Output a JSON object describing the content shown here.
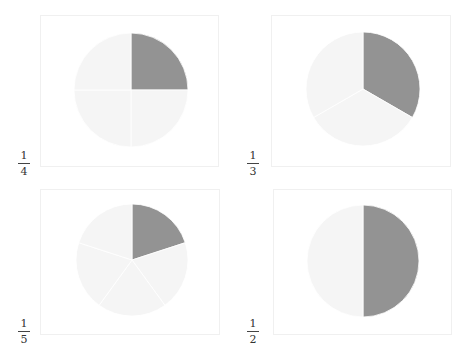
{
  "chart_data": [
    {
      "type": "pie",
      "title": "",
      "label": {
        "numerator": "1",
        "denominator": "4"
      },
      "fraction": 0.25,
      "slices": [
        {
          "name": "highlighted",
          "value": 1,
          "color": "#939393"
        },
        {
          "name": "rest-1",
          "value": 1,
          "color": "#f5f5f5"
        },
        {
          "name": "rest-2",
          "value": 1,
          "color": "#f5f5f5"
        },
        {
          "name": "rest-3",
          "value": 1,
          "color": "#f5f5f5"
        }
      ],
      "start_angle": "12 o'clock, clockwise"
    },
    {
      "type": "pie",
      "title": "",
      "label": {
        "numerator": "1",
        "denominator": "3"
      },
      "fraction": 0.3333,
      "slices": [
        {
          "name": "highlighted",
          "value": 1,
          "color": "#939393"
        },
        {
          "name": "rest-1",
          "value": 1,
          "color": "#f5f5f5"
        },
        {
          "name": "rest-2",
          "value": 1,
          "color": "#f5f5f5"
        }
      ],
      "start_angle": "12 o'clock, clockwise"
    },
    {
      "type": "pie",
      "title": "",
      "label": {
        "numerator": "1",
        "denominator": "5"
      },
      "fraction": 0.2,
      "slices": [
        {
          "name": "highlighted",
          "value": 1,
          "color": "#939393"
        },
        {
          "name": "rest-1",
          "value": 1,
          "color": "#f5f5f5"
        },
        {
          "name": "rest-2",
          "value": 1,
          "color": "#f5f5f5"
        },
        {
          "name": "rest-3",
          "value": 1,
          "color": "#f5f5f5"
        },
        {
          "name": "rest-4",
          "value": 1,
          "color": "#f5f5f5"
        }
      ],
      "start_angle": "12 o'clock, clockwise"
    },
    {
      "type": "pie",
      "title": "",
      "label": {
        "numerator": "1",
        "denominator": "2"
      },
      "fraction": 0.5,
      "slices": [
        {
          "name": "highlighted",
          "value": 1,
          "color": "#939393"
        },
        {
          "name": "rest-1",
          "value": 1,
          "color": "#f5f5f5"
        }
      ],
      "start_angle": "12 o'clock, clockwise"
    }
  ],
  "colors": {
    "highlight": "#939393",
    "rest": "#f5f5f5",
    "divider": "#ffffff",
    "panel_border": "#f0f0f0"
  }
}
